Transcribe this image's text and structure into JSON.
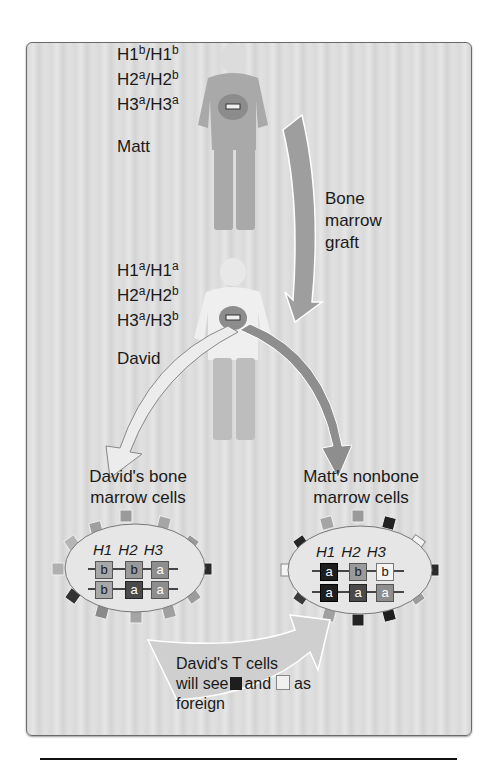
{
  "matt": {
    "genotype": [
      {
        "locus": "H1",
        "a1": "b",
        "a2": "b"
      },
      {
        "locus": "H2",
        "a1": "a",
        "a2": "b"
      },
      {
        "locus": "H3",
        "a1": "a",
        "a2": "a"
      }
    ],
    "name": "Matt"
  },
  "david": {
    "genotype": [
      {
        "locus": "H1",
        "a1": "a",
        "a2": "a"
      },
      {
        "locus": "H2",
        "a1": "a",
        "a2": "b"
      },
      {
        "locus": "H3",
        "a1": "a",
        "a2": "b"
      }
    ],
    "name": "David"
  },
  "graft_label": {
    "line1": "Bone",
    "line2": "marrow",
    "line3": "graft"
  },
  "left_cell": {
    "title_line1": "David's bone",
    "title_line2": "marrow cells",
    "loci": [
      "H1",
      "H2",
      "H3"
    ],
    "row1": [
      "b",
      "b",
      "a"
    ],
    "row2": [
      "b",
      "a",
      "a"
    ]
  },
  "right_cell": {
    "title_line1": "Matt's nonbone",
    "title_line2": "marrow cells",
    "loci": [
      "H1",
      "H2",
      "H3"
    ],
    "row1": [
      "a",
      "b",
      "b"
    ],
    "row2": [
      "a",
      "a",
      "a"
    ]
  },
  "callout": {
    "line1": "David's T cells",
    "line2_a": "will see",
    "line2_b": "and",
    "line2_c": "as",
    "line3": "foreign"
  },
  "colors": {
    "H1a": "#1e1e1e",
    "H1b": "#a8a8a8",
    "H2a": "#4a4a4a",
    "H2b": "#9a9a9a",
    "H3a": "#8e8e8e",
    "H3b": "#f4f4f4",
    "frame_bg": "#dedede"
  }
}
